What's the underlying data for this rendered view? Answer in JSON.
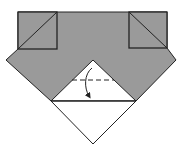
{
  "diagram": {
    "type": "origami-fold-step",
    "colors": {
      "colored_side": "#9a9a9a",
      "white_side": "#ffffff",
      "outline": "#222222",
      "background": "#ffffff"
    },
    "shapes": {
      "gray_body": "18,12 167,12 167,48 176,60 136,101 51,101 6,60 18,49",
      "white_triangle": "93,60 136,101 51,101",
      "bottom_triangle": "51,101 136,101 93,144",
      "left_square": {
        "x": 18,
        "y": 12,
        "w": 39,
        "h": 37
      },
      "right_square": {
        "x": 129,
        "y": 12,
        "w": 38,
        "h": 36
      },
      "left_square_diagonal": "18,49 57,12",
      "right_square_diagonal": "129,12 167,48",
      "valley_fold_line": "72,80 114,80",
      "fold_arrow": "valley fold down"
    },
    "annotations": {
      "fold_line_style": "dashed (valley fold)",
      "arrow_direction": "fold top point down"
    }
  }
}
